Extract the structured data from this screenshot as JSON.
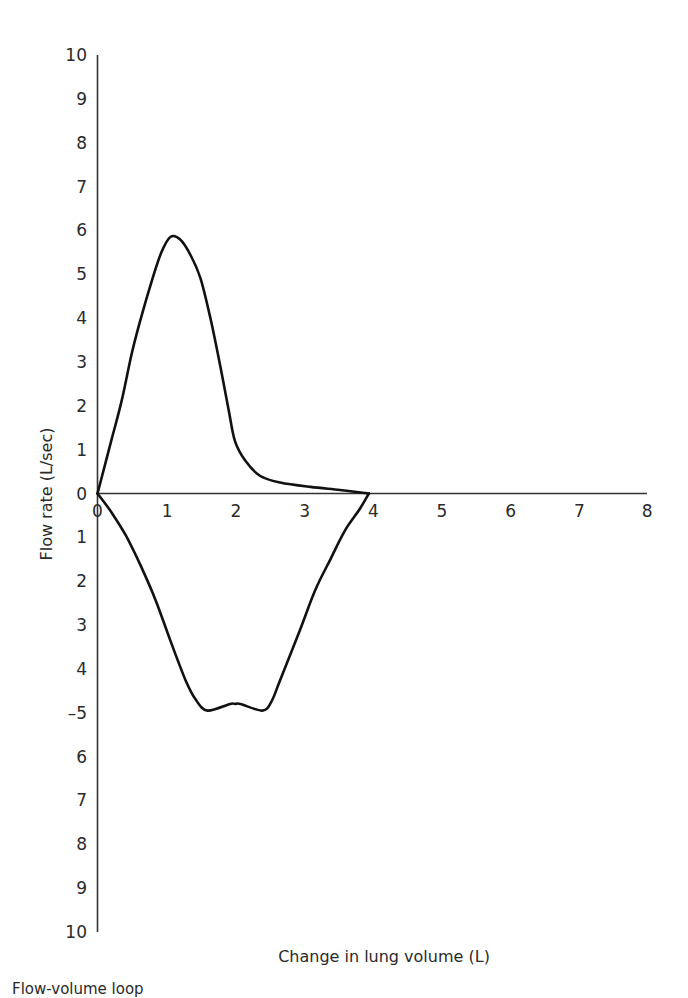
{
  "chart_data": {
    "type": "line",
    "title": "",
    "xlabel": "Change in lung volume (L)",
    "ylabel": "Flow rate (L/sec)",
    "xlim": [
      0,
      8
    ],
    "ylim": [
      -10,
      10
    ],
    "grid": false,
    "legend": null,
    "x_ticks": [
      "0",
      "1",
      "2",
      "3",
      "4",
      "5",
      "6",
      "7",
      "8"
    ],
    "y_ticks": [
      "10",
      "9",
      "8",
      "7",
      "6",
      "5",
      "4",
      "3",
      "2",
      "1",
      "0",
      "1",
      "2",
      "3",
      "4",
      "–5",
      "6",
      "7",
      "8",
      "9",
      "10"
    ],
    "series": [
      {
        "name": "Expiratory limb",
        "x": [
          0,
          0.2,
          0.35,
          0.5,
          0.65,
          0.8,
          0.93,
          1.06,
          1.2,
          1.35,
          1.5,
          1.65,
          1.8,
          1.91,
          2.0,
          2.15,
          2.37,
          2.66,
          3.1,
          3.53,
          3.95
        ],
        "y": [
          0,
          1.2,
          2.1,
          3.2,
          4.1,
          4.9,
          5.5,
          5.85,
          5.8,
          5.45,
          4.9,
          3.95,
          2.8,
          1.9,
          1.2,
          0.75,
          0.4,
          0.25,
          0.15,
          0.08,
          0
        ]
      },
      {
        "name": "Inspiratory limb",
        "x": [
          0,
          0.19,
          0.41,
          0.63,
          0.85,
          1.06,
          1.28,
          1.43,
          1.6,
          1.93,
          2.0,
          2.08,
          2.4,
          2.53,
          2.66,
          2.95,
          3.17,
          3.39,
          3.6,
          3.82,
          3.95
        ],
        "y": [
          0,
          -0.4,
          -0.95,
          -1.65,
          -2.45,
          -3.35,
          -4.25,
          -4.7,
          -4.95,
          -4.8,
          -4.8,
          -4.8,
          -4.95,
          -4.75,
          -4.25,
          -3.1,
          -2.2,
          -1.5,
          -0.85,
          -0.35,
          0
        ]
      }
    ],
    "annotations": [
      "Peak expiratory flow ≈ 5.9 L/sec at ≈ 1 L",
      "Loop closes at ≈ 4 L (vital capacity)"
    ]
  },
  "labels": {
    "x_axis_title": "Change in lung volume (L)",
    "y_axis_title": "Flow rate (L/sec)",
    "caption": "Flow-volume loop"
  }
}
